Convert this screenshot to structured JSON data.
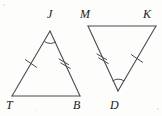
{
  "figure": {
    "background_color": "#fdfdfc",
    "stroke_color": "#4a4a52",
    "label_color": "#1a1a1a",
    "stroke_width": 1.1
  },
  "triangles": [
    {
      "name": "triangle-JTB",
      "orientation": "apex-up",
      "vertices": [
        {
          "label": "J",
          "x": 50,
          "y": 31,
          "label_x": 47,
          "label_y": 8
        },
        {
          "label": "T",
          "x": 12,
          "y": 96,
          "label_x": 6,
          "label_y": 99
        },
        {
          "label": "B",
          "x": 80,
          "y": 96,
          "label_x": 73,
          "label_y": 99
        }
      ],
      "angle_mark": {
        "at": "J",
        "marks": 1
      },
      "sides": [
        {
          "from": "J",
          "to": "T",
          "ticks": 1
        },
        {
          "from": "J",
          "to": "B",
          "ticks": 2
        },
        {
          "from": "T",
          "to": "B",
          "ticks": 0
        }
      ]
    },
    {
      "name": "triangle-MKD",
      "orientation": "apex-down",
      "vertices": [
        {
          "label": "M",
          "x": 88,
          "y": 26,
          "label_x": 80,
          "label_y": 8
        },
        {
          "label": "K",
          "x": 156,
          "y": 26,
          "label_x": 143,
          "label_y": 8
        },
        {
          "label": "D",
          "x": 118,
          "y": 91,
          "label_x": 110,
          "label_y": 99
        }
      ],
      "angle_mark": {
        "at": "D",
        "marks": 1
      },
      "sides": [
        {
          "from": "M",
          "to": "D",
          "ticks": 2
        },
        {
          "from": "K",
          "to": "D",
          "ticks": 1
        },
        {
          "from": "M",
          "to": "K",
          "ticks": 0
        }
      ]
    }
  ],
  "labels": {
    "J": "J",
    "T": "T",
    "B": "B",
    "M": "M",
    "K": "K",
    "D": "D"
  }
}
